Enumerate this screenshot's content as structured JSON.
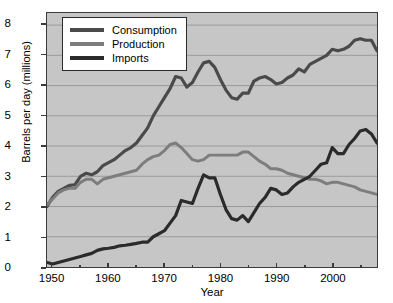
{
  "chart_data": {
    "type": "line",
    "title": "",
    "xlabel": "Year",
    "ylabel": "Barrels per day (millions)",
    "xlim": [
      1949,
      2008
    ],
    "ylim": [
      0,
      8.4
    ],
    "xticks": [
      1950,
      1960,
      1970,
      1980,
      1990,
      2000
    ],
    "yticks": [
      0,
      1,
      2,
      3,
      4,
      5,
      6,
      7,
      8
    ],
    "grid": "horizontal",
    "legend_position": "top-left",
    "plot_background": "#c6c6c6",
    "gridline_color": "#9a9a9a",
    "axis_color": "#3a3a3a",
    "x": [
      1949,
      1950,
      1951,
      1952,
      1953,
      1954,
      1955,
      1956,
      1957,
      1958,
      1959,
      1960,
      1961,
      1962,
      1963,
      1964,
      1965,
      1966,
      1967,
      1968,
      1969,
      1970,
      1971,
      1972,
      1973,
      1974,
      1975,
      1976,
      1977,
      1978,
      1979,
      1980,
      1981,
      1982,
      1983,
      1984,
      1985,
      1986,
      1987,
      1988,
      1989,
      1990,
      1991,
      1992,
      1993,
      1994,
      1995,
      1996,
      1997,
      1998,
      1999,
      2000,
      2001,
      2002,
      2003,
      2004,
      2005,
      2006,
      2007,
      2008
    ],
    "series": [
      {
        "name": "Consumption",
        "color": "#4a4a4a",
        "width": 3.2,
        "values": [
          2.0,
          2.3,
          2.5,
          2.6,
          2.7,
          2.72,
          3.0,
          3.1,
          3.05,
          3.15,
          3.35,
          3.45,
          3.55,
          3.7,
          3.85,
          3.95,
          4.1,
          4.35,
          4.6,
          5.0,
          5.3,
          5.6,
          5.9,
          6.3,
          6.25,
          5.95,
          6.1,
          6.45,
          6.75,
          6.8,
          6.6,
          6.2,
          5.85,
          5.6,
          5.55,
          5.75,
          5.75,
          6.15,
          6.25,
          6.3,
          6.2,
          6.05,
          6.1,
          6.25,
          6.35,
          6.55,
          6.45,
          6.7,
          6.8,
          6.9,
          7.0,
          7.2,
          7.15,
          7.2,
          7.3,
          7.5,
          7.55,
          7.5,
          7.5,
          7.15
        ]
      },
      {
        "name": "Production",
        "color": "#7d7d7d",
        "width": 3.0,
        "values": [
          2.05,
          2.25,
          2.45,
          2.55,
          2.6,
          2.6,
          2.8,
          2.9,
          2.9,
          2.75,
          2.9,
          2.95,
          3.0,
          3.05,
          3.1,
          3.15,
          3.2,
          3.4,
          3.55,
          3.65,
          3.7,
          3.85,
          4.05,
          4.1,
          3.95,
          3.75,
          3.55,
          3.5,
          3.55,
          3.7,
          3.7,
          3.7,
          3.7,
          3.7,
          3.7,
          3.8,
          3.8,
          3.65,
          3.5,
          3.4,
          3.25,
          3.25,
          3.2,
          3.1,
          3.05,
          3.0,
          2.95,
          2.9,
          2.9,
          2.85,
          2.75,
          2.8,
          2.8,
          2.75,
          2.7,
          2.65,
          2.55,
          2.5,
          2.45,
          2.4
        ]
      },
      {
        "name": "Imports",
        "color": "#2b2b2b",
        "width": 3.2,
        "values": [
          0.15,
          0.1,
          0.15,
          0.2,
          0.25,
          0.3,
          0.35,
          0.4,
          0.45,
          0.55,
          0.6,
          0.62,
          0.65,
          0.7,
          0.72,
          0.75,
          0.78,
          0.82,
          0.82,
          1.0,
          1.1,
          1.2,
          1.45,
          1.7,
          2.2,
          2.15,
          2.1,
          2.6,
          3.05,
          2.95,
          2.95,
          2.4,
          1.9,
          1.6,
          1.55,
          1.7,
          1.5,
          1.8,
          2.1,
          2.3,
          2.6,
          2.55,
          2.4,
          2.45,
          2.65,
          2.8,
          2.9,
          3.0,
          3.2,
          3.4,
          3.45,
          3.95,
          3.75,
          3.75,
          4.05,
          4.25,
          4.5,
          4.55,
          4.4,
          4.1
        ]
      }
    ]
  },
  "legend": {
    "entries": [
      {
        "label": "Consumption"
      },
      {
        "label": "Production"
      },
      {
        "label": "Imports"
      }
    ]
  }
}
